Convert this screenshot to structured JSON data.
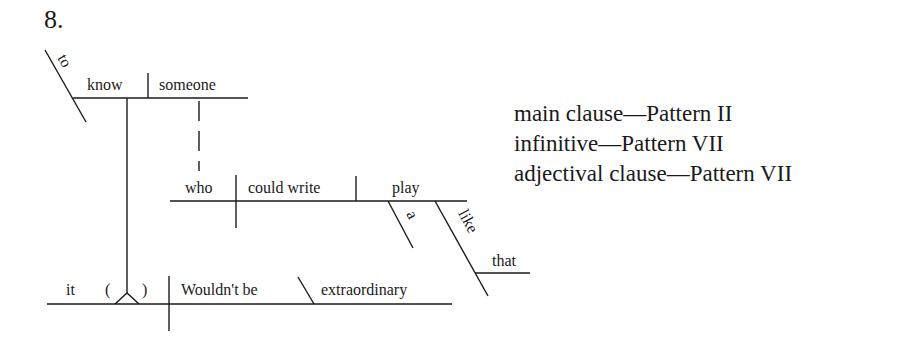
{
  "exercise": {
    "number": "8."
  },
  "diagram": {
    "infinitive_phrase": {
      "marker": "to",
      "verb": "know",
      "object": "someone"
    },
    "adjectival_clause": {
      "subject": "who",
      "verb": "could write",
      "object": "play",
      "modifier_object": "a",
      "preposition": "like",
      "prep_object": "that"
    },
    "main_clause": {
      "subject": "it",
      "open_paren": "(",
      "close_paren": ")",
      "verb": "Wouldn't be",
      "complement": "extraordinary"
    }
  },
  "notes": [
    {
      "label": "main clause",
      "dash": "—",
      "pattern": "Pattern II"
    },
    {
      "label": "infinitive",
      "dash": "—",
      "pattern": "Pattern VII"
    },
    {
      "label": "adjectival clause",
      "dash": "—",
      "pattern": "Pattern VII"
    }
  ]
}
